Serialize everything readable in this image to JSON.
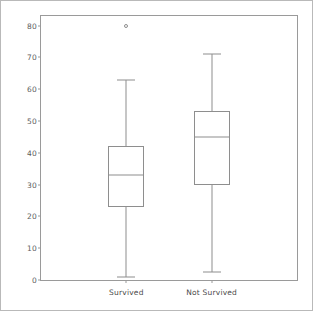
{
  "chart_data": {
    "type": "box",
    "title": "",
    "xlabel": "",
    "ylabel": "",
    "grid": false,
    "legend": "none",
    "ylim": [
      0,
      83
    ],
    "yticks": [
      0,
      10,
      20,
      30,
      40,
      50,
      60,
      70,
      80
    ],
    "categories": [
      "Survived",
      "Not Survived"
    ],
    "boxes": [
      {
        "name": "Survived",
        "min": 1,
        "q1": 23,
        "median": 33,
        "q3": 42,
        "max": 63,
        "outliers": [
          80
        ]
      },
      {
        "name": "Not Survived",
        "min": 2.5,
        "q1": 30,
        "median": 45,
        "q3": 53,
        "max": 71,
        "outliers": []
      }
    ]
  },
  "axis": {
    "y_tick_labels": [
      "80",
      "70",
      "60",
      "50",
      "40",
      "30",
      "20",
      "10",
      "0"
    ],
    "x_tick_labels": [
      "Survived",
      "Not Survived"
    ]
  },
  "colors": {
    "line": "#8e8e8e",
    "frame": "#9a9a9a",
    "page_border": "#b9b9b9",
    "tick_text": "#5d5d5d",
    "label_text": "#4a4a4a",
    "background": "#ffffff"
  }
}
